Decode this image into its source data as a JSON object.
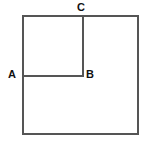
{
  "figure": {
    "background_color": "#ffffff",
    "stroke_color": "#555555",
    "label_color": "#111111",
    "stroke_width": 1.5,
    "canvas": {
      "width": 149,
      "height": 144
    },
    "labels": [
      {
        "id": "C",
        "text": "C",
        "x": 81,
        "y": 8,
        "anchor": "top of inner vertical segment"
      },
      {
        "id": "A",
        "text": "A",
        "x": 13,
        "y": 75,
        "anchor": "left end of inner horizontal segment"
      },
      {
        "id": "B",
        "text": "B",
        "x": 89,
        "y": 75,
        "anchor": "right end of inner horizontal segment"
      }
    ],
    "shapes": [
      {
        "name": "outer-square",
        "type": "rect",
        "x": 23,
        "y": 16,
        "width": 115,
        "height": 118
      },
      {
        "name": "inner-vertical-segment",
        "type": "line",
        "x1": 83,
        "y1": 16,
        "x2": 83,
        "y2": 76,
        "endpoints": [
          "C",
          "B"
        ]
      },
      {
        "name": "inner-horizontal-segment",
        "type": "line",
        "x1": 23,
        "y1": 76,
        "x2": 83,
        "y2": 76,
        "endpoints": [
          "A",
          "B"
        ]
      }
    ],
    "inner_square": {
      "name": "inner-square-region",
      "x": 23,
      "y": 16,
      "width": 60,
      "height": 60
    }
  }
}
